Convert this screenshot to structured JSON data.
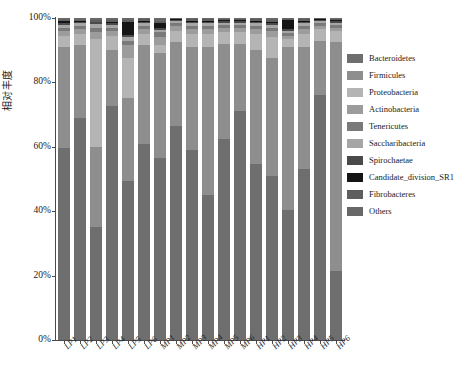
{
  "chart_data": {
    "type": "bar",
    "subtype": "stacked-percentage",
    "title": "",
    "xlabel": "",
    "ylabel": "相对丰度",
    "ylim": [
      0,
      100
    ],
    "ytick_labels": [
      "0%",
      "20%",
      "40%",
      "60%",
      "80%",
      "100%"
    ],
    "ytick_values": [
      0,
      20,
      40,
      60,
      80,
      100
    ],
    "grid": false,
    "legend_position": "right",
    "categories": [
      "LP1",
      "LP2",
      "LP3",
      "LP4",
      "LP5",
      "LP6",
      "MP1",
      "MP2",
      "MP3",
      "MP4",
      "MP5",
      "MP6",
      "HP1",
      "HP2",
      "HP3",
      "HP4",
      "HP5",
      "HP6"
    ],
    "series": [
      {
        "name": "Bacteroidetes",
        "color": "#6e6e6e",
        "hatch": true,
        "values": [
          59.5,
          69.0,
          35.0,
          72.5,
          49.5,
          61.0,
          56.5,
          66.5,
          59.0,
          45.0,
          62.5,
          71.0,
          54.5,
          51.0,
          40.5,
          53.0,
          76.0,
          21.5
        ]
      },
      {
        "name": "Firmicules",
        "color": "#8e8e8e",
        "hatch": false,
        "values": [
          31.5,
          22.5,
          25.0,
          17.5,
          25.5,
          30.5,
          32.5,
          26.0,
          32.0,
          46.0,
          29.5,
          21.0,
          35.5,
          36.5,
          50.5,
          38.0,
          17.0,
          71.0
        ]
      },
      {
        "name": "Proteobacteria",
        "color": "#b4b4b4",
        "hatch": false,
        "values": [
          3.5,
          3.5,
          33.5,
          4.5,
          12.5,
          3.5,
          2.5,
          3.5,
          4.0,
          4.0,
          3.5,
          3.5,
          5.0,
          6.5,
          2.5,
          4.0,
          3.5,
          3.5
        ]
      },
      {
        "name": "Actinobacteria",
        "color": "#9c9c9c",
        "hatch": false,
        "values": [
          1.5,
          1.5,
          2.0,
          1.5,
          4.0,
          1.5,
          2.5,
          1.5,
          1.5,
          1.5,
          1.5,
          1.5,
          1.5,
          2.0,
          1.0,
          1.5,
          1.0,
          1.0
        ]
      },
      {
        "name": "Tenericutes",
        "color": "#7a7a7a",
        "hatch": false,
        "values": [
          1.0,
          1.0,
          1.5,
          1.0,
          1.5,
          1.0,
          1.5,
          0.8,
          1.0,
          1.0,
          0.8,
          0.8,
          1.0,
          1.0,
          0.8,
          1.0,
          0.8,
          0.8
        ]
      },
      {
        "name": "Saccharibacteria",
        "color": "#a6a6a6",
        "hatch": false,
        "values": [
          0.8,
          0.8,
          1.0,
          0.8,
          1.0,
          0.8,
          0.8,
          0.7,
          0.8,
          0.8,
          0.7,
          0.7,
          0.8,
          0.8,
          0.7,
          0.8,
          0.7,
          0.7
        ]
      },
      {
        "name": "Spirochaetae",
        "color": "#4a4a4a",
        "hatch": false,
        "values": [
          0.7,
          0.6,
          0.6,
          0.6,
          0.8,
          0.6,
          0.6,
          0.5,
          0.6,
          0.6,
          0.5,
          0.5,
          0.6,
          0.6,
          0.5,
          0.6,
          0.5,
          0.5
        ]
      },
      {
        "name": "Candidate_division_SR1",
        "color": "#151515",
        "hatch": false,
        "values": [
          0.5,
          0.3,
          0.3,
          0.3,
          4.0,
          0.3,
          1.5,
          0.3,
          0.3,
          0.3,
          0.3,
          0.3,
          0.3,
          0.3,
          3.0,
          0.3,
          0.3,
          0.3
        ]
      },
      {
        "name": "Fibrobacteres",
        "color": "#5e5e5e",
        "hatch": false,
        "values": [
          0.5,
          0.3,
          0.6,
          0.8,
          0.7,
          0.4,
          0.8,
          0.2,
          0.4,
          0.4,
          0.4,
          0.3,
          0.4,
          0.8,
          0.3,
          0.4,
          0.2,
          0.4
        ]
      },
      {
        "name": "Others",
        "color": "#686868",
        "hatch": true,
        "values": [
          0.5,
          0.5,
          0.5,
          0.5,
          0.5,
          0.4,
          0.8,
          0.0,
          0.4,
          0.4,
          0.3,
          0.4,
          0.4,
          0.5,
          0.2,
          0.4,
          0.0,
          0.3
        ]
      }
    ]
  },
  "legend": {
    "entries": [
      {
        "label": "Bacteroidetes",
        "color": "#6e6e6e"
      },
      {
        "label": "Firmicules",
        "color": "#8e8e8e"
      },
      {
        "label": "Proteobacteria",
        "color": "#b4b4b4"
      },
      {
        "label": "Actinobacteria",
        "color": "#9c9c9c"
      },
      {
        "label": "Tenericutes",
        "color": "#7a7a7a"
      },
      {
        "label": "Saccharibacteria",
        "color": "#a6a6a6"
      },
      {
        "label": "Spirochaetae",
        "color": "#4a4a4a"
      },
      {
        "label": "Candidate_division_SR1",
        "color": "#151515"
      },
      {
        "label": "Fibrobacteres",
        "color": "#5e5e5e"
      },
      {
        "label": "Others",
        "color": "#686868"
      }
    ]
  },
  "axes": {
    "y_title": "相对丰度",
    "y_ticks": [
      "100%",
      "80%",
      "60%",
      "40%",
      "20%",
      "0%"
    ],
    "x_ticks": [
      "LP1",
      "LP2",
      "LP3",
      "LP4",
      "LP5",
      "LP6",
      "MP1",
      "MP2",
      "MP3",
      "MP4",
      "MP5",
      "MP6",
      "HP1",
      "HP2",
      "HP3",
      "HP4",
      "HP5",
      "HP6"
    ]
  }
}
